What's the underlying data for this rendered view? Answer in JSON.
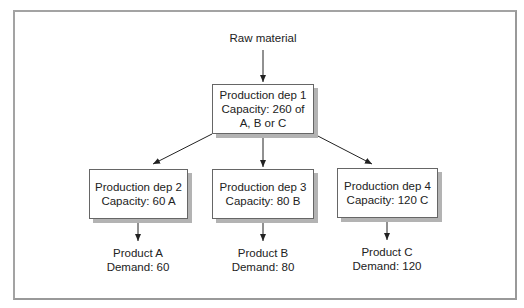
{
  "diagram": {
    "source": {
      "label": "Raw material"
    },
    "root": {
      "id": "dep1",
      "lines": [
        "Production dep 1",
        "Capacity: 260 of",
        "A, B or C"
      ]
    },
    "departments": [
      {
        "id": "dep2",
        "lines": [
          "Production dep 2",
          "Capacity: 60 A"
        ]
      },
      {
        "id": "dep3",
        "lines": [
          "Production dep 3",
          "Capacity: 80 B"
        ]
      },
      {
        "id": "dep4",
        "lines": [
          "Production dep 4",
          "Capacity: 120 C"
        ]
      }
    ],
    "products": [
      {
        "id": "productA",
        "lines": [
          "Product A",
          "Demand: 60"
        ]
      },
      {
        "id": "productB",
        "lines": [
          "Product B",
          "Demand: 80"
        ]
      },
      {
        "id": "productC",
        "lines": [
          "Product C",
          "Demand: 120"
        ]
      }
    ],
    "edges": [
      {
        "from": "Raw material",
        "to": "dep1"
      },
      {
        "from": "dep1",
        "to": "dep2"
      },
      {
        "from": "dep1",
        "to": "dep3"
      },
      {
        "from": "dep1",
        "to": "dep4"
      },
      {
        "from": "dep2",
        "to": "productA"
      },
      {
        "from": "dep3",
        "to": "productB"
      },
      {
        "from": "dep4",
        "to": "productC"
      }
    ]
  },
  "colors": {
    "frame": "#a3a3a3",
    "box_border": "#666666",
    "box_shadow": "#b3b3b3",
    "arrow": "#222222",
    "text": "#222222"
  }
}
